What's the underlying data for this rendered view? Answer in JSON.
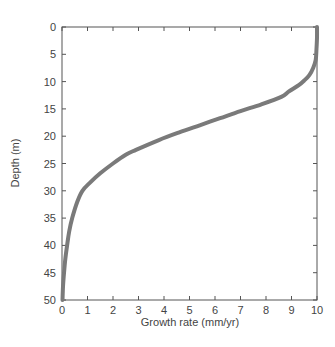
{
  "chart_data": {
    "type": "line",
    "title": "",
    "xlabel": "Growth rate (mm/yr)",
    "ylabel": "Depth (m)",
    "xlim": [
      0,
      10
    ],
    "ylim": [
      0,
      50
    ],
    "y_inverted": true,
    "grid": false,
    "legend": null,
    "x_ticks": [
      0,
      1,
      2,
      3,
      4,
      5,
      6,
      7,
      8,
      9,
      10
    ],
    "y_ticks": [
      0,
      5,
      10,
      15,
      20,
      25,
      30,
      35,
      40,
      45,
      50
    ],
    "series": [
      {
        "name": "growth-rate-profile",
        "color": "#7a7a7a",
        "line_width": 4,
        "points": [
          {
            "x": 10.0,
            "y": 0
          },
          {
            "x": 10.0,
            "y": 2
          },
          {
            "x": 9.98,
            "y": 4
          },
          {
            "x": 9.95,
            "y": 6
          },
          {
            "x": 9.85,
            "y": 7.5
          },
          {
            "x": 9.7,
            "y": 8.8
          },
          {
            "x": 9.5,
            "y": 9.8
          },
          {
            "x": 9.3,
            "y": 10.6
          },
          {
            "x": 8.9,
            "y": 11.8
          },
          {
            "x": 8.6,
            "y": 12.8
          },
          {
            "x": 7.8,
            "y": 14.2
          },
          {
            "x": 7.0,
            "y": 15.4
          },
          {
            "x": 6.2,
            "y": 16.7
          },
          {
            "x": 5.4,
            "y": 18.0
          },
          {
            "x": 4.6,
            "y": 19.3
          },
          {
            "x": 3.8,
            "y": 20.7
          },
          {
            "x": 2.9,
            "y": 22.5
          },
          {
            "x": 2.5,
            "y": 23.4
          },
          {
            "x": 2.0,
            "y": 25.0
          },
          {
            "x": 1.5,
            "y": 26.8
          },
          {
            "x": 1.1,
            "y": 28.5
          },
          {
            "x": 0.8,
            "y": 30.0
          },
          {
            "x": 0.6,
            "y": 32.0
          },
          {
            "x": 0.4,
            "y": 35.0
          },
          {
            "x": 0.28,
            "y": 37.5
          },
          {
            "x": 0.2,
            "y": 40.0
          },
          {
            "x": 0.13,
            "y": 42.5
          },
          {
            "x": 0.08,
            "y": 45.0
          },
          {
            "x": 0.04,
            "y": 47.5
          },
          {
            "x": 0.02,
            "y": 50.0
          }
        ]
      }
    ]
  },
  "plot_area": {
    "left": 62,
    "top": 27,
    "right": 317,
    "bottom": 300
  },
  "colors": {
    "axis": "#555555",
    "curve": "#7a7a7a",
    "background": "#ffffff"
  }
}
